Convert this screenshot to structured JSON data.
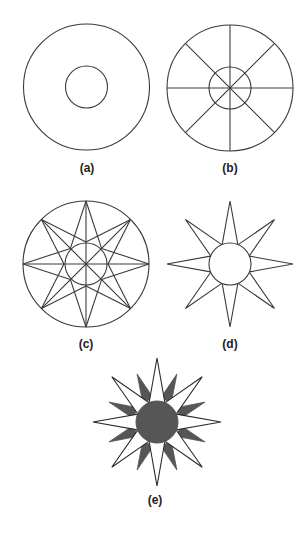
{
  "figure": {
    "stroke_color": "#3a3a3a",
    "fill_dark": "#565656",
    "background": "#ffffff",
    "panels": [
      {
        "id": "a",
        "label": "(a)",
        "step": "Two concentric circles",
        "center": [
          86.5,
          87
        ],
        "outer_r": 63,
        "inner_r": 21
      },
      {
        "id": "b",
        "label": "(b)",
        "step": "Circles divided by 8 radial lines (every 45°)",
        "center": [
          230,
          88
        ],
        "outer_r": 63,
        "inner_r": 21,
        "radial_lines": 8
      },
      {
        "id": "c",
        "label": "(c)",
        "step": "Star point outlines drawn from outer tips to inner circle",
        "center": [
          86,
          264
        ],
        "outer_r": 63,
        "inner_r": 21,
        "points": 8
      },
      {
        "id": "d",
        "label": "(d)",
        "step": "Construction lines erased leaving 8-pointed star around circle",
        "center": [
          230,
          264
        ],
        "outer_r": 63,
        "inner_r": 21,
        "points": 8
      },
      {
        "id": "e",
        "label": "(e)",
        "step": "16-pointed star with dark secondary points and filled center",
        "center": [
          157,
          422
        ],
        "outer_r": 64,
        "inner_r": 21,
        "secondary_r": 52,
        "points": 8,
        "secondary_points": 8
      }
    ]
  }
}
